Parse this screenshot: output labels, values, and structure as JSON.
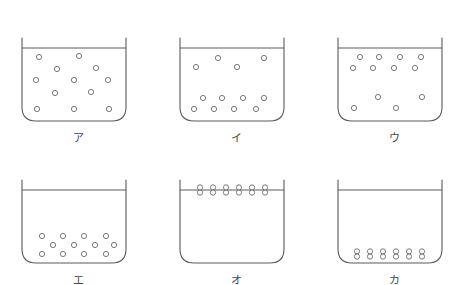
{
  "figure": {
    "name": "beaker-particle-distribution-diagram",
    "stroke_color": "#5a5a5a",
    "particle_stroke": "#6a6a6a",
    "particle_fill": "#ffffff",
    "background": "#ffffff",
    "columns": 3,
    "rows": 2
  },
  "beakers": [
    {
      "id": "beaker-a",
      "label": "ア",
      "grid": {
        "col": 0,
        "row": 0
      },
      "water_line_y": 30,
      "description": "particles spread evenly throughout the liquid",
      "particles": [
        {
          "x": 17,
          "y": 39,
          "stacked": false
        },
        {
          "x": 57,
          "y": 38,
          "stacked": false
        },
        {
          "x": 35,
          "y": 51,
          "stacked": false
        },
        {
          "x": 74,
          "y": 50,
          "stacked": false
        },
        {
          "x": 14,
          "y": 62,
          "stacked": false
        },
        {
          "x": 52,
          "y": 62,
          "stacked": false
        },
        {
          "x": 86,
          "y": 62,
          "stacked": false
        },
        {
          "x": 33,
          "y": 75,
          "stacked": false
        },
        {
          "x": 69,
          "y": 74,
          "stacked": false
        },
        {
          "x": 15,
          "y": 91,
          "stacked": false
        },
        {
          "x": 52,
          "y": 91,
          "stacked": false
        },
        {
          "x": 87,
          "y": 91,
          "stacked": false
        }
      ]
    },
    {
      "id": "beaker-i",
      "label": "イ",
      "grid": {
        "col": 1,
        "row": 0
      },
      "water_line_y": 30,
      "description": "a few particles above, a denser pair of rows near the bottom",
      "particles": [
        {
          "x": 38,
          "y": 40,
          "stacked": false
        },
        {
          "x": 84,
          "y": 40,
          "stacked": false
        },
        {
          "x": 16,
          "y": 49,
          "stacked": false
        },
        {
          "x": 57,
          "y": 49,
          "stacked": false
        },
        {
          "x": 23,
          "y": 80,
          "stacked": false
        },
        {
          "x": 42,
          "y": 80,
          "stacked": false
        },
        {
          "x": 63,
          "y": 80,
          "stacked": false
        },
        {
          "x": 84,
          "y": 80,
          "stacked": false
        },
        {
          "x": 14,
          "y": 91,
          "stacked": false
        },
        {
          "x": 34,
          "y": 91,
          "stacked": false
        },
        {
          "x": 54,
          "y": 91,
          "stacked": false
        },
        {
          "x": 76,
          "y": 91,
          "stacked": false
        }
      ]
    },
    {
      "id": "beaker-u",
      "label": "ウ",
      "grid": {
        "col": 2,
        "row": 0
      },
      "water_line_y": 30,
      "description": "two dense rows just under the surface, a few scattered below",
      "particles": [
        {
          "x": 22,
          "y": 39,
          "stacked": false
        },
        {
          "x": 41,
          "y": 39,
          "stacked": false
        },
        {
          "x": 62,
          "y": 39,
          "stacked": false
        },
        {
          "x": 83,
          "y": 39,
          "stacked": false
        },
        {
          "x": 15,
          "y": 50,
          "stacked": false
        },
        {
          "x": 35,
          "y": 50,
          "stacked": false
        },
        {
          "x": 56,
          "y": 50,
          "stacked": false
        },
        {
          "x": 77,
          "y": 50,
          "stacked": false
        },
        {
          "x": 40,
          "y": 79,
          "stacked": false
        },
        {
          "x": 84,
          "y": 79,
          "stacked": false
        },
        {
          "x": 16,
          "y": 90,
          "stacked": false
        },
        {
          "x": 58,
          "y": 90,
          "stacked": false
        }
      ]
    },
    {
      "id": "beaker-e",
      "label": "エ",
      "grid": {
        "col": 0,
        "row": 1
      },
      "water_line_y": 30,
      "description": "all particles settled in three rows at the bottom",
      "particles": [
        {
          "x": 20,
          "y": 76,
          "stacked": false
        },
        {
          "x": 41,
          "y": 76,
          "stacked": false
        },
        {
          "x": 62,
          "y": 76,
          "stacked": false
        },
        {
          "x": 84,
          "y": 76,
          "stacked": false
        },
        {
          "x": 31,
          "y": 85,
          "stacked": false
        },
        {
          "x": 52,
          "y": 85,
          "stacked": false
        },
        {
          "x": 73,
          "y": 85,
          "stacked": false
        },
        {
          "x": 92,
          "y": 85,
          "stacked": false
        },
        {
          "x": 20,
          "y": 94,
          "stacked": false
        },
        {
          "x": 41,
          "y": 94,
          "stacked": false
        },
        {
          "x": 62,
          "y": 94,
          "stacked": false
        },
        {
          "x": 84,
          "y": 94,
          "stacked": false
        }
      ]
    },
    {
      "id": "beaker-o",
      "label": "オ",
      "grid": {
        "col": 1,
        "row": 1
      },
      "water_line_y": 30,
      "description": "paired particles collected in a line at the water surface",
      "particles": [
        {
          "x": 20,
          "y": 30,
          "stacked": true
        },
        {
          "x": 33,
          "y": 30,
          "stacked": true
        },
        {
          "x": 46,
          "y": 30,
          "stacked": true
        },
        {
          "x": 59,
          "y": 30,
          "stacked": true
        },
        {
          "x": 72,
          "y": 30,
          "stacked": true
        },
        {
          "x": 85,
          "y": 30,
          "stacked": true
        }
      ]
    },
    {
      "id": "beaker-ka",
      "label": "カ",
      "grid": {
        "col": 2,
        "row": 1
      },
      "water_line_y": 30,
      "description": "paired particles collected in a line on the beaker floor",
      "particles": [
        {
          "x": 19,
          "y": 94,
          "stacked": true
        },
        {
          "x": 32,
          "y": 94,
          "stacked": true
        },
        {
          "x": 45,
          "y": 94,
          "stacked": true
        },
        {
          "x": 58,
          "y": 94,
          "stacked": true
        },
        {
          "x": 71,
          "y": 94,
          "stacked": true
        },
        {
          "x": 84,
          "y": 94,
          "stacked": true
        }
      ]
    }
  ]
}
